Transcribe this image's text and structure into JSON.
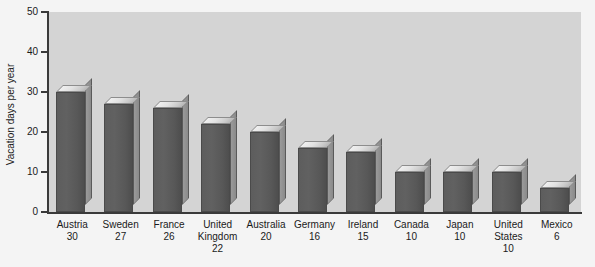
{
  "chart_data": {
    "type": "bar",
    "title": "",
    "subtitle": "",
    "xlabel": "",
    "ylabel": "Vacation days per year",
    "ylim": [
      0,
      50
    ],
    "yticks": [
      0,
      10,
      20,
      30,
      40,
      50
    ],
    "grid": false,
    "legend": null,
    "style": "3d-bar",
    "categories": [
      "Austria",
      "Sweden",
      "France",
      "United Kingdom",
      "Australia",
      "Germany",
      "Ireland",
      "Canada",
      "Japan",
      "United States",
      "Mexico"
    ],
    "category_label_lines": [
      [
        "Austria"
      ],
      [
        "Sweden"
      ],
      [
        "France"
      ],
      [
        "United",
        "Kingdom"
      ],
      [
        "Australia"
      ],
      [
        "Germany"
      ],
      [
        "Ireland"
      ],
      [
        "Canada"
      ],
      [
        "Japan"
      ],
      [
        "United",
        "States"
      ],
      [
        "Mexico"
      ]
    ],
    "values": [
      30,
      27,
      26,
      22,
      20,
      16,
      15,
      10,
      10,
      10,
      6
    ],
    "value_labels": [
      "30",
      "27",
      "26",
      "22",
      "20",
      "16",
      "15",
      "10",
      "10",
      "10",
      "6"
    ],
    "colors": {
      "bar_front": "#5d5d5d",
      "bar_top": "#e2e2e2",
      "bar_side": "#8f8f8f",
      "plot_background": "#d4d4d4",
      "figure_background": "#f4f4f4",
      "axis": "#3a3a3a",
      "text": "#1a1a1a"
    }
  }
}
